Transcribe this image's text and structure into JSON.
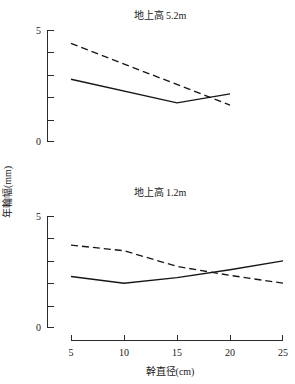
{
  "figure": {
    "y_axis_title": "年輪幅(mm)",
    "x_axis_title": "幹直径(cm)"
  },
  "panels": [
    {
      "id": "panel-top",
      "title": "地上高 5.2m"
    },
    {
      "id": "panel-bottom",
      "title": "地上高 1.2m"
    }
  ],
  "ticks": {
    "y_top": [
      "5",
      "0"
    ],
    "y_bottom": [
      "5",
      "0"
    ],
    "x": [
      "5",
      "10",
      "15",
      "20",
      "25"
    ]
  },
  "chart_data": [
    {
      "type": "line",
      "title": "地上高 5.2m",
      "xlabel": "幹直径(cm)",
      "ylabel": "年輪幅(mm)",
      "xlim": [
        5,
        25
      ],
      "ylim": [
        0,
        5
      ],
      "xticks": [
        5,
        10,
        15,
        20,
        25
      ],
      "yticks": [
        0,
        1,
        2,
        3,
        4,
        5
      ],
      "ytick_labels": [
        "0",
        "",
        "",
        "",
        "",
        "5"
      ],
      "grid": false,
      "legend": "none",
      "series": [
        {
          "name": "solid",
          "style": "solid",
          "x": [
            5,
            15,
            20
          ],
          "values": [
            2.8,
            1.75,
            2.15
          ]
        },
        {
          "name": "dashed",
          "style": "dashed",
          "x": [
            5,
            20
          ],
          "values": [
            4.4,
            1.65
          ]
        }
      ]
    },
    {
      "type": "line",
      "title": "地上高 1.2m",
      "xlabel": "幹直径(cm)",
      "ylabel": "年輪幅(mm)",
      "xlim": [
        5,
        25
      ],
      "ylim": [
        0,
        5
      ],
      "xticks": [
        5,
        10,
        15,
        20,
        25
      ],
      "yticks": [
        0,
        1,
        2,
        3,
        4,
        5
      ],
      "ytick_labels": [
        "0",
        "",
        "",
        "",
        "",
        "5"
      ],
      "grid": false,
      "legend": "none",
      "series": [
        {
          "name": "solid",
          "style": "solid",
          "x": [
            5,
            10,
            15,
            20,
            25
          ],
          "values": [
            2.3,
            2.0,
            2.25,
            2.6,
            3.0
          ]
        },
        {
          "name": "dashed",
          "style": "dashed",
          "x": [
            5,
            10,
            15,
            20,
            25
          ],
          "values": [
            3.7,
            3.45,
            2.75,
            2.35,
            2.0
          ]
        }
      ]
    }
  ]
}
